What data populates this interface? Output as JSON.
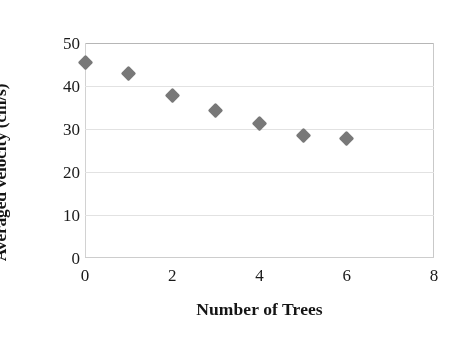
{
  "chart_data": {
    "type": "scatter",
    "title": "",
    "xlabel": "Number  of Trees",
    "ylabel": "Averaged velocity (cm/s)",
    "xlim": [
      0,
      8
    ],
    "ylim": [
      0,
      50
    ],
    "xticks": [
      0,
      2,
      4,
      6,
      8
    ],
    "yticks": [
      0,
      10,
      20,
      30,
      40,
      50
    ],
    "grid": "horizontal",
    "legend": "none",
    "marker": "diamond",
    "marker_color": "#787878",
    "series": [
      {
        "name": "Averaged velocity",
        "x": [
          0,
          1,
          2,
          3,
          4,
          5,
          6
        ],
        "values": [
          45.4,
          43.0,
          37.9,
          34.4,
          31.2,
          28.4,
          27.7
        ]
      }
    ],
    "points": [
      {
        "x": 0,
        "y": 45.4
      },
      {
        "x": 1,
        "y": 43.0
      },
      {
        "x": 2,
        "y": 37.9
      },
      {
        "x": 3,
        "y": 34.4
      },
      {
        "x": 4,
        "y": 31.2
      },
      {
        "x": 5,
        "y": 28.4
      },
      {
        "x": 6,
        "y": 27.7
      }
    ]
  },
  "axes": {
    "y_tick_labels": [
      "50",
      "40",
      "30",
      "20",
      "10",
      "0"
    ],
    "x_tick_labels": [
      "0",
      "2",
      "4",
      "6",
      "8"
    ]
  },
  "colors": {
    "marker": "#787878",
    "gridline": "#e2e2e2",
    "frame": "#c9c9c9",
    "text": "#151515",
    "background": "#ffffff"
  }
}
